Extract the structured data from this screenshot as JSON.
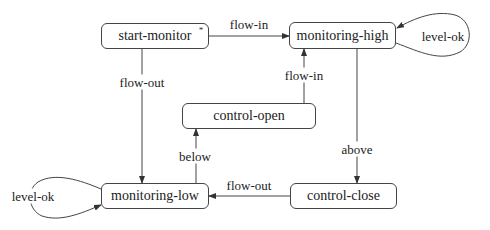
{
  "diagram": {
    "type": "state-machine",
    "states": [
      {
        "id": "start-monitor",
        "label": "start-monitor",
        "initial": true,
        "marker": "*"
      },
      {
        "id": "monitoring-high",
        "label": "monitoring-high"
      },
      {
        "id": "control-open",
        "label": "control-open"
      },
      {
        "id": "monitoring-low",
        "label": "monitoring-low"
      },
      {
        "id": "control-close",
        "label": "control-close"
      }
    ],
    "transitions": [
      {
        "from": "start-monitor",
        "to": "monitoring-high",
        "label": "flow-in"
      },
      {
        "from": "start-monitor",
        "to": "monitoring-low",
        "label": "flow-out"
      },
      {
        "from": "monitoring-high",
        "to": "monitoring-high",
        "label": "level-ok"
      },
      {
        "from": "monitoring-high",
        "to": "control-close",
        "label": "above"
      },
      {
        "from": "control-open",
        "to": "monitoring-high",
        "label": "flow-in"
      },
      {
        "from": "monitoring-low",
        "to": "control-open",
        "label": "below"
      },
      {
        "from": "control-close",
        "to": "monitoring-low",
        "label": "flow-out"
      },
      {
        "from": "monitoring-low",
        "to": "monitoring-low",
        "label": "level-ok"
      }
    ]
  }
}
